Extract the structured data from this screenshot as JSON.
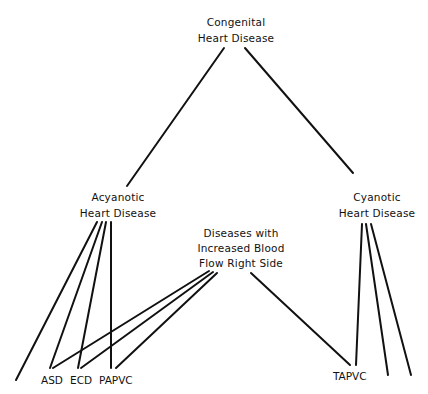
{
  "diagram": {
    "type": "tree",
    "nodes": {
      "root": {
        "line1": "Congenital",
        "line2": "Heart Disease"
      },
      "acyanotic": {
        "line1": "Acyanotic",
        "line2": "Heart Disease"
      },
      "cyanotic": {
        "line1": "Cyanotic",
        "line2": "Heart Disease"
      },
      "increased_flow": {
        "line1": "Diseases with",
        "line2": "Increased Blood",
        "line3": "Flow Right Side"
      }
    },
    "leaves": {
      "asd": "ASD",
      "ecd": "ECD",
      "papvc": "PAPVC",
      "tapvc": "TAPVC"
    },
    "edges": [
      {
        "from": "root",
        "to": "acyanotic"
      },
      {
        "from": "root",
        "to": "cyanotic"
      },
      {
        "from": "acyanotic",
        "to": "unlabeled-left"
      },
      {
        "from": "acyanotic",
        "to": "asd"
      },
      {
        "from": "acyanotic",
        "to": "ecd"
      },
      {
        "from": "acyanotic",
        "to": "papvc"
      },
      {
        "from": "increased_flow",
        "to": "asd"
      },
      {
        "from": "increased_flow",
        "to": "ecd"
      },
      {
        "from": "increased_flow",
        "to": "papvc"
      },
      {
        "from": "increased_flow",
        "to": "tapvc"
      },
      {
        "from": "cyanotic",
        "to": "tapvc"
      },
      {
        "from": "cyanotic",
        "to": "unlabeled-right-1"
      },
      {
        "from": "cyanotic",
        "to": "unlabeled-right-2"
      }
    ],
    "line_color": "#111111"
  }
}
